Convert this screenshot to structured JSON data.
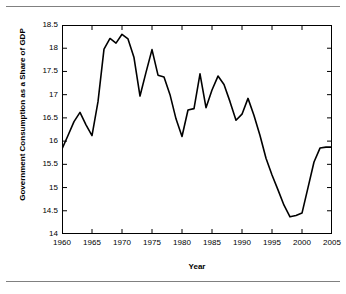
{
  "figure": {
    "background": "#ffffff",
    "rule_color": "#808080",
    "axis_color": "#000000",
    "line_color": "#000000"
  },
  "chart_data": {
    "type": "line",
    "title": "",
    "xlabel": "Year",
    "ylabel": "Government Consumption as a Share of GDP",
    "xlim": [
      1960,
      2005
    ],
    "ylim": [
      14,
      18.5
    ],
    "xticks": [
      1960,
      1965,
      1970,
      1975,
      1980,
      1985,
      1990,
      1995,
      2000,
      2005
    ],
    "xtick_labels": [
      "1960",
      "1965",
      "1970",
      "1975",
      "1980",
      "1985",
      "1990",
      "1995",
      "2000",
      "2005"
    ],
    "yticks": [
      14,
      14.5,
      15,
      15.5,
      16,
      16.5,
      17,
      17.5,
      18,
      18.5
    ],
    "ytick_labels": [
      "14",
      "14.5",
      "15",
      "15.5",
      "16",
      "16.5",
      "17",
      "17.5",
      "18",
      "18.5"
    ],
    "grid": false,
    "legend": "none",
    "series": [
      {
        "name": "Government Consumption as a Share of GDP",
        "color": "#000000",
        "x": [
          1960,
          1961,
          1962,
          1963,
          1964,
          1965,
          1966,
          1967,
          1968,
          1969,
          1970,
          1971,
          1972,
          1973,
          1974,
          1975,
          1976,
          1977,
          1978,
          1979,
          1980,
          1981,
          1982,
          1983,
          1984,
          1985,
          1986,
          1987,
          1988,
          1989,
          1990,
          1991,
          1992,
          1993,
          1994,
          1995,
          1996,
          1997,
          1998,
          1999,
          2000,
          2001,
          2002,
          2003,
          2004,
          2005
        ],
        "y": [
          15.83,
          16.12,
          16.42,
          16.62,
          16.35,
          16.12,
          16.85,
          17.98,
          18.21,
          18.11,
          18.3,
          18.2,
          17.8,
          16.97,
          17.48,
          17.97,
          17.42,
          17.38,
          17.0,
          16.48,
          16.1,
          16.67,
          16.7,
          17.45,
          16.72,
          17.1,
          17.4,
          17.22,
          16.85,
          16.45,
          16.58,
          16.92,
          16.55,
          16.12,
          15.63,
          15.27,
          14.95,
          14.62,
          14.37,
          14.4,
          14.45,
          15.0,
          15.55,
          15.85,
          15.87,
          15.87
        ]
      }
    ]
  }
}
